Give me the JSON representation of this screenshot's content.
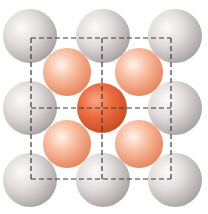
{
  "diagram": {
    "colors": {
      "background": "#ffffff",
      "grey_atom_light": "#f6f4f4",
      "grey_atom_mid": "#d9d4d4",
      "grey_atom_dark": "#a9a2a2",
      "orange_light_highlight": "#fff0e6",
      "orange_light_mid": "#f8b89a",
      "orange_light_dark": "#e98a64",
      "orange_center_highlight": "#f9a27e",
      "orange_center_mid": "#ee6a3e",
      "orange_center_dark": "#c94d25",
      "dashed_line": "#3a3a3a"
    },
    "grey_atoms": [
      {
        "cx": 30,
        "cy": 36,
        "r": 27
      },
      {
        "cx": 103,
        "cy": 36,
        "r": 27
      },
      {
        "cx": 175,
        "cy": 36,
        "r": 27
      },
      {
        "cx": 30,
        "cy": 108,
        "r": 27
      },
      {
        "cx": 175,
        "cy": 108,
        "r": 27
      },
      {
        "cx": 30,
        "cy": 180,
        "r": 27
      },
      {
        "cx": 103,
        "cy": 180,
        "r": 27
      },
      {
        "cx": 175,
        "cy": 180,
        "r": 27
      }
    ],
    "light_orange_atoms": [
      {
        "cx": 67,
        "cy": 72,
        "r": 24
      },
      {
        "cx": 139,
        "cy": 72,
        "r": 24
      },
      {
        "cx": 67,
        "cy": 144,
        "r": 24
      },
      {
        "cx": 139,
        "cy": 144,
        "r": 24
      }
    ],
    "center_atom": {
      "cx": 102,
      "cy": 108,
      "r": 25
    },
    "unit_cell": {
      "x": 31,
      "y": 38,
      "width": 140,
      "height": 141
    },
    "cross": {
      "x": 102,
      "y": 108
    }
  }
}
